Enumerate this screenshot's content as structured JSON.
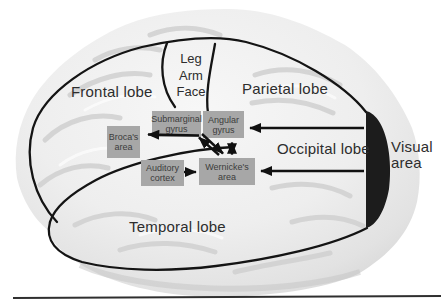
{
  "diagram": {
    "lobe_labels": {
      "frontal": "Frontal lobe",
      "parietal": "Parietal lobe",
      "occipital": "Occipital lobe",
      "temporal": "Temporal lobe",
      "visual": "Visual area"
    },
    "motor_labels": [
      "Leg",
      "Arm",
      "Face"
    ],
    "area_boxes": [
      {
        "id": "submarginal-gyrus",
        "line1": "Submarginal",
        "line2": "gyrus"
      },
      {
        "id": "angular-gyrus",
        "line1": "Angular",
        "line2": "gyrus"
      },
      {
        "id": "brocas-area",
        "line1": "Broca's",
        "line2": "area"
      },
      {
        "id": "auditory-cortex",
        "line1": "Auditory",
        "line2": "cortex"
      },
      {
        "id": "wernickes-area",
        "line1": "Wernicke's",
        "line2": "area"
      }
    ],
    "connections": [
      {
        "from": "visual-area",
        "to": "angular-gyrus",
        "type": "arrow"
      },
      {
        "from": "visual-area",
        "to": "wernickes-area",
        "type": "arrow"
      },
      {
        "from": "submarginal-gyrus",
        "to": "brocas-area",
        "type": "arrow"
      },
      {
        "from": "auditory-cortex",
        "to": "wernickes-area",
        "type": "arrow"
      },
      {
        "from": "angular-gyrus",
        "to": "wernickes-area",
        "type": "double-arrow"
      },
      {
        "from": "wernickes-area",
        "to": "submarginal-gyrus",
        "type": "double-arrow"
      }
    ],
    "colors": {
      "box_fill": "#a7a7a7",
      "box_text": "#3c3c3c",
      "label_text": "#2d2d2d",
      "outline": "#141414",
      "visual_area_fill": "#1c1c1c",
      "brain_light": "#f5f5f5",
      "brain_shade": "#d9d9d9"
    }
  }
}
